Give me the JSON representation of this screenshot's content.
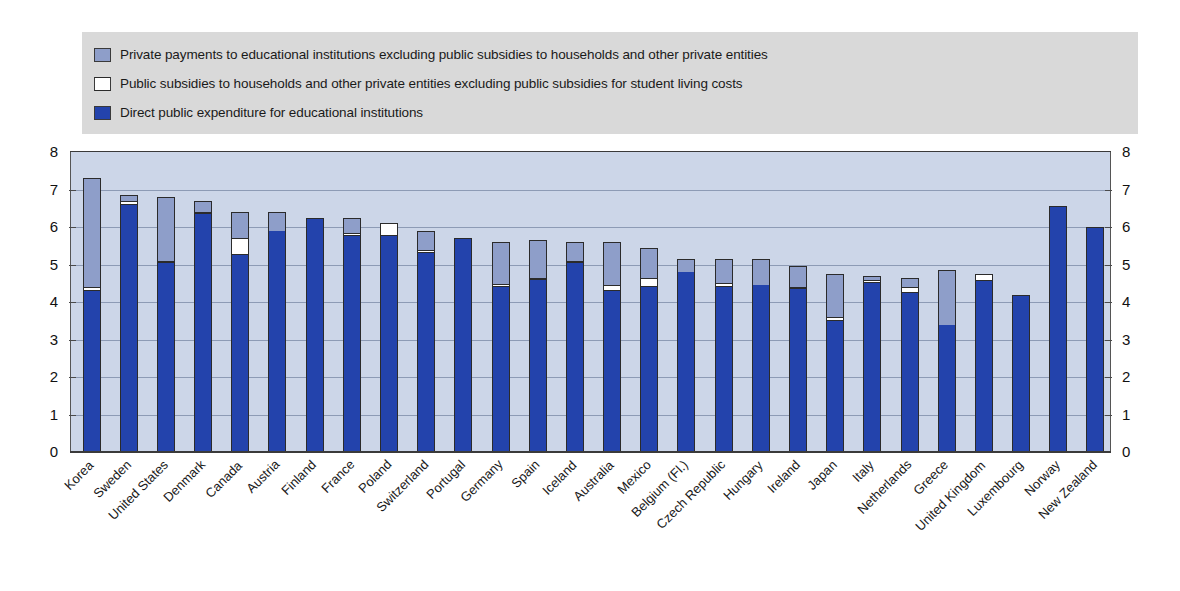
{
  "legend": {
    "items": [
      {
        "key": "private",
        "label": "Private payments to educational institutions excluding public subsidies to households and other private entities",
        "color": "#8e9ec9"
      },
      {
        "key": "subsidy",
        "label": "Public subsidies to households and other private entities excluding public subsidies for student living costs",
        "color": "#ffffff"
      },
      {
        "key": "public",
        "label": "Direct public expenditure for educational institutions",
        "color": "#2343ac"
      }
    ]
  },
  "axis": {
    "ticks_left": [
      "8",
      "7",
      "6",
      "5",
      "4",
      "3",
      "2",
      "1",
      "0"
    ],
    "ticks_right": [
      "8",
      "7",
      "6",
      "5",
      "4",
      "3",
      "2",
      "1",
      "0"
    ]
  },
  "chart_data": {
    "type": "bar",
    "subtype": "stacked",
    "title": "",
    "xlabel": "",
    "ylabel": "",
    "ylim": [
      0,
      8
    ],
    "yticks": [
      0,
      1,
      2,
      3,
      4,
      5,
      6,
      7,
      8
    ],
    "grid": true,
    "legend_position": "top",
    "categories": [
      "Korea",
      "Sweden",
      "United States",
      "Denmark",
      "Canada",
      "Austria",
      "Finland",
      "France",
      "Poland",
      "Switzerland",
      "Portugal",
      "Germany",
      "Spain",
      "Iceland",
      "Australia",
      "Mexico",
      "Belgium (Fl.)",
      "Czech Republic",
      "Hungary",
      "Ireland",
      "Japan",
      "Italy",
      "Netherlands",
      "Greece",
      "United Kingdom",
      "Luxembourg",
      "Norway",
      "New Zealand"
    ],
    "series": [
      {
        "name": "Direct public expenditure for educational institutions",
        "color": "#2343ac",
        "values": [
          4.3,
          6.6,
          5.05,
          6.35,
          5.25,
          5.9,
          6.25,
          5.75,
          5.75,
          5.3,
          5.7,
          4.4,
          4.6,
          5.05,
          4.3,
          4.4,
          4.8,
          4.4,
          4.45,
          4.35,
          3.5,
          4.5,
          4.25,
          3.4,
          4.55,
          4.2,
          6.55,
          6.0
        ]
      },
      {
        "name": "Public subsidies to households and other private entities excluding public subsidies for student living costs",
        "color": "#ffffff",
        "values": [
          0.1,
          0.1,
          0.05,
          0.05,
          0.45,
          0.0,
          0.0,
          0.08,
          0.35,
          0.08,
          0.0,
          0.08,
          0.05,
          0.05,
          0.15,
          0.25,
          0.0,
          0.1,
          0.0,
          0.05,
          0.1,
          0.08,
          0.15,
          0.0,
          0.2,
          0.0,
          0.0,
          0.0
        ]
      },
      {
        "name": "Private payments to educational institutions excluding public subsidies to households and other private entities",
        "color": "#8e9ec9",
        "values": [
          2.9,
          0.15,
          1.7,
          0.3,
          0.7,
          0.5,
          0.0,
          0.42,
          0.0,
          0.52,
          0.0,
          1.12,
          1.0,
          0.5,
          1.15,
          0.8,
          0.35,
          0.65,
          0.7,
          0.55,
          1.15,
          0.12,
          0.25,
          1.45,
          0.0,
          0.0,
          0.0,
          0.0
        ]
      }
    ],
    "totals": [
      7.3,
      6.85,
      6.8,
      6.7,
      6.4,
      6.4,
      6.25,
      6.25,
      6.1,
      5.9,
      5.7,
      5.6,
      5.65,
      5.6,
      5.6,
      5.45,
      5.15,
      5.15,
      5.15,
      4.95,
      4.75,
      4.7,
      4.65,
      4.85,
      4.75,
      4.2,
      6.55,
      6.0
    ]
  }
}
